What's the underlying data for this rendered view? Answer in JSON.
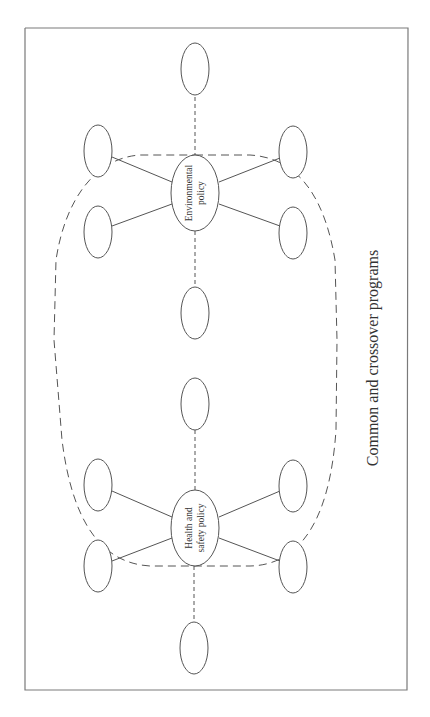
{
  "diagram": {
    "orientation": "rotated-90-ccw",
    "hubs": [
      {
        "id": "environmental",
        "line1": "Environmental",
        "line2": "policy"
      },
      {
        "id": "health-safety",
        "line1": "Health and",
        "line2": "safety policy"
      }
    ],
    "caption": "Common and crossover programs",
    "satellite_node_count_per_hub": 6,
    "edge_styles": {
      "diagonal_links": "solid",
      "axis_links": "dashed",
      "common_boundary": "dashed rounded region"
    }
  }
}
